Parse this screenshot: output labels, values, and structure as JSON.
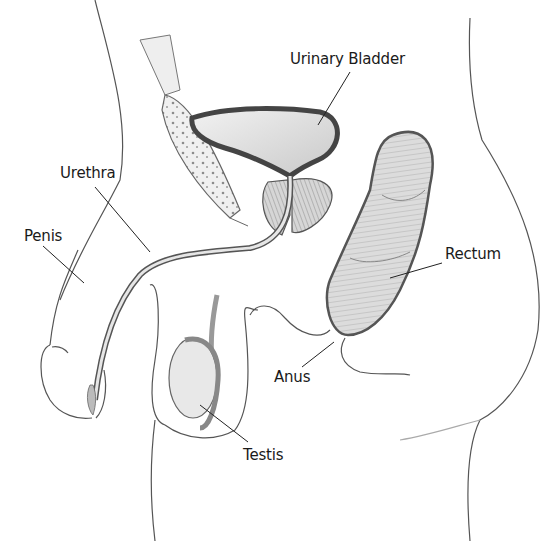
{
  "diagram": {
    "type": "anatomical-illustration",
    "labels": [
      {
        "id": "urinary-bladder",
        "text": "Urinary Bladder",
        "x": 290,
        "y": 50
      },
      {
        "id": "urethra",
        "text": "Urethra",
        "x": 60,
        "y": 164
      },
      {
        "id": "penis",
        "text": "Penis",
        "x": 24,
        "y": 227
      },
      {
        "id": "rectum",
        "text": "Rectum",
        "x": 445,
        "y": 245
      },
      {
        "id": "anus",
        "text": "Anus",
        "x": 274,
        "y": 368
      },
      {
        "id": "testis",
        "text": "Testis",
        "x": 243,
        "y": 446
      }
    ],
    "colors": {
      "line": "#3a3a3a",
      "bladder_wall": "#5a5a5a",
      "organ_fill": "#d8d8d8",
      "label_text": "#1a1a1a"
    }
  }
}
